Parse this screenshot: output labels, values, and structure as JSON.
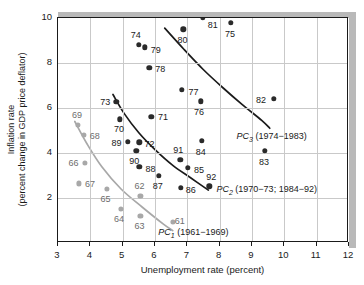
{
  "chart_data": {
    "type": "scatter",
    "title": "",
    "xlabel": "Unemployment rate (percent)",
    "ylabel_line1": "Inflation rate",
    "ylabel_line2": "(percent change in GDP price deflator)",
    "xlim": [
      3,
      12
    ],
    "ylim": [
      0,
      10
    ],
    "xticks": [
      3,
      4,
      5,
      6,
      7,
      8,
      9,
      10,
      11,
      12
    ],
    "yticks": [
      2,
      4,
      6,
      8,
      10
    ],
    "grid": true,
    "legend_position": "inline-annotations",
    "series": [
      {
        "name": "PC1 (1961-1969)",
        "color": "#a8a8a8",
        "points": [
          {
            "label": "61",
            "x": 6.55,
            "y": 0.95,
            "label_dx": 7,
            "label_dy": -1
          },
          {
            "label": "62",
            "x": 5.55,
            "y": 2.1,
            "label_dx": -1,
            "label_dy": -10
          },
          {
            "label": "63",
            "x": 5.55,
            "y": 1.2,
            "label_dx": -1,
            "label_dy": 10
          },
          {
            "label": "64",
            "x": 4.95,
            "y": 1.5,
            "label_dx": -2,
            "label_dy": 10
          },
          {
            "label": "65",
            "x": 4.5,
            "y": 2.4,
            "label_dx": -1,
            "label_dy": 10
          },
          {
            "label": "66",
            "x": 3.82,
            "y": 3.55,
            "label_dx": -11,
            "label_dy": 0
          },
          {
            "label": "67",
            "x": 3.65,
            "y": 2.65,
            "label_dx": 11,
            "label_dy": 1
          },
          {
            "label": "68",
            "x": 3.8,
            "y": 4.8,
            "label_dx": 11,
            "label_dy": 1
          },
          {
            "label": "69",
            "x": 3.62,
            "y": 5.25,
            "label_dx": -1,
            "label_dy": -10
          }
        ]
      },
      {
        "name": "PC2 (1970-73; 1984-92)",
        "color": "#2a2a2a",
        "points": [
          {
            "label": "70",
            "x": 4.92,
            "y": 5.5,
            "label_dx": -1,
            "label_dy": 10
          },
          {
            "label": "71",
            "x": 5.88,
            "y": 5.6,
            "label_dx": 12,
            "label_dy": 0
          },
          {
            "label": "72",
            "x": 5.52,
            "y": 4.48,
            "label_dx": 10,
            "label_dy": 2
          },
          {
            "label": "73",
            "x": 4.8,
            "y": 6.28,
            "label_dx": -11,
            "label_dy": 0
          },
          {
            "label": "84",
            "x": 7.45,
            "y": 4.55,
            "label_dx": -1,
            "label_dy": 11
          },
          {
            "label": "85",
            "x": 7.02,
            "y": 3.35,
            "label_dx": 11,
            "label_dy": 2
          },
          {
            "label": "86",
            "x": 6.8,
            "y": 2.45,
            "label_dx": 10,
            "label_dy": 2
          },
          {
            "label": "87",
            "x": 6.12,
            "y": 3.0,
            "label_dx": -1,
            "label_dy": 10
          },
          {
            "label": "88",
            "x": 5.52,
            "y": 3.4,
            "label_dx": 11,
            "label_dy": 2
          },
          {
            "label": "89",
            "x": 5.15,
            "y": 4.5,
            "label_dx": -11,
            "label_dy": 1
          },
          {
            "label": "90",
            "x": 5.42,
            "y": 4.1,
            "label_dx": -2,
            "label_dy": 10
          },
          {
            "label": "91",
            "x": 6.78,
            "y": 3.7,
            "label_dx": -2,
            "label_dy": -10
          },
          {
            "label": "92",
            "x": 7.68,
            "y": 2.52,
            "label_dx": 2,
            "label_dy": -9
          }
        ]
      },
      {
        "name": "PC3 (1974-1983)",
        "color": "#2a2a2a",
        "points": [
          {
            "label": "74",
            "x": 5.5,
            "y": 8.82,
            "label_dx": -3,
            "label_dy": -10
          },
          {
            "label": "75",
            "x": 8.35,
            "y": 9.78,
            "label_dx": -1,
            "label_dy": 11
          },
          {
            "label": "76",
            "x": 7.42,
            "y": 6.3,
            "label_dx": -2,
            "label_dy": 11
          },
          {
            "label": "77",
            "x": 6.82,
            "y": 6.8,
            "label_dx": 12,
            "label_dy": 2
          },
          {
            "label": "78",
            "x": 5.82,
            "y": 7.8,
            "label_dx": 11,
            "label_dy": 1
          },
          {
            "label": "79",
            "x": 5.68,
            "y": 8.7,
            "label_dx": 11,
            "label_dy": 3
          },
          {
            "label": "80",
            "x": 6.88,
            "y": 9.5,
            "label_dx": -1,
            "label_dy": 11
          },
          {
            "label": "81",
            "x": 7.48,
            "y": 10.0,
            "label_dx": 10,
            "label_dy": 7
          },
          {
            "label": "82",
            "x": 9.68,
            "y": 6.4,
            "label_dx": -13,
            "label_dy": 1
          },
          {
            "label": "83",
            "x": 9.4,
            "y": 4.1,
            "label_dx": -1,
            "label_dy": 11
          }
        ]
      }
    ],
    "curves": [
      {
        "name": "PC1",
        "color": "#a8a8a8",
        "label_text_plain": "PC",
        "label_sub": "1",
        "label_paren": " (1961−1969)",
        "label_x": 6.1,
        "label_y": 0.45,
        "path_points": [
          [
            3.52,
            5.4
          ],
          [
            3.9,
            4.4
          ],
          [
            4.35,
            3.4
          ],
          [
            4.95,
            2.4
          ],
          [
            5.6,
            1.6
          ],
          [
            6.25,
            0.85
          ],
          [
            6.55,
            0.55
          ]
        ]
      },
      {
        "name": "PC2",
        "color": "#1a1a1a",
        "label_text_plain": "PC",
        "label_sub": "2",
        "label_paren": " (1970−73; 1984−92)",
        "label_x": 7.9,
        "label_y": 2.35,
        "path_points": [
          [
            4.7,
            6.6
          ],
          [
            5.05,
            5.75
          ],
          [
            5.5,
            4.9
          ],
          [
            6.0,
            4.15
          ],
          [
            6.55,
            3.45
          ],
          [
            7.1,
            2.9
          ],
          [
            7.65,
            2.35
          ]
        ]
      },
      {
        "name": "PC3",
        "color": "#1a1a1a",
        "label_text_plain": "PC",
        "label_sub": "3",
        "label_paren": " (1974−1983)",
        "label_x": 8.52,
        "label_y": 4.7,
        "path_points": [
          [
            6.3,
            9.55
          ],
          [
            6.9,
            8.6
          ],
          [
            7.5,
            7.7
          ],
          [
            8.1,
            6.9
          ],
          [
            8.7,
            6.15
          ],
          [
            9.3,
            5.45
          ],
          [
            9.55,
            5.1
          ]
        ]
      }
    ]
  }
}
